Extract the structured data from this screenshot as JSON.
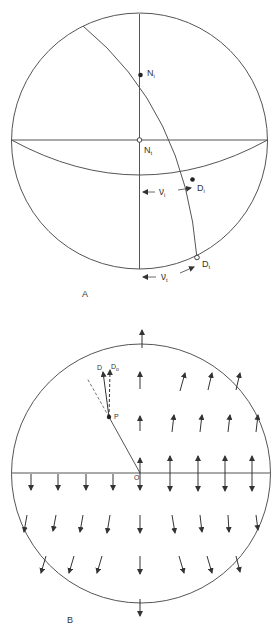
{
  "figure_a": {
    "label": "A",
    "points": {
      "n_i": {
        "main": "N",
        "sub": "i"
      },
      "n_t": {
        "main": "N",
        "sub": "t"
      },
      "d_i": {
        "main": "D",
        "sub": "i"
      },
      "d_t": {
        "main": "D",
        "sub": "t"
      }
    },
    "angles": {
      "nu_i": {
        "main": "ν",
        "sub": "i"
      },
      "nu_t": {
        "main": "ν",
        "sub": "t"
      }
    }
  },
  "figure_b": {
    "label": "B",
    "points": {
      "origin": "O",
      "p": "P",
      "d": "D",
      "d_o": {
        "main": "D",
        "sub": "o"
      }
    }
  },
  "colors": {
    "line": "#555555",
    "text": "#333333",
    "background": "#ffffff"
  }
}
